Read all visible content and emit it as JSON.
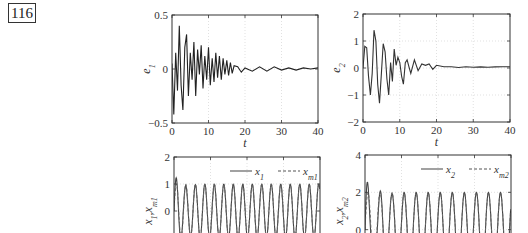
{
  "page": {
    "number": "116"
  },
  "chart_data": [
    {
      "id": "e1",
      "type": "line",
      "title": "",
      "xlabel": "t",
      "ylabel": "e1",
      "xlim": [
        0,
        40
      ],
      "ylim": [
        -0.5,
        0.5
      ],
      "xticks": [
        "0",
        "10",
        "20",
        "30",
        "40"
      ],
      "yticks": [
        "-0.5",
        "0",
        "0.5"
      ],
      "grid": true,
      "series": [
        {
          "name": "e1",
          "style": "solid",
          "color": "#222222",
          "x": [
            0,
            0.5,
            1,
            1.5,
            2,
            2.5,
            3,
            3.5,
            4,
            4.5,
            5,
            5.5,
            6,
            6.5,
            7,
            7.5,
            8,
            8.5,
            9,
            9.5,
            10,
            10.5,
            11,
            11.5,
            12,
            12.5,
            13,
            13.5,
            14,
            14.5,
            15,
            15.5,
            16,
            16.5,
            17,
            18,
            19,
            20,
            22,
            24,
            26,
            28,
            30,
            32,
            34,
            36,
            38,
            40
          ],
          "y": [
            0.05,
            -0.42,
            0.15,
            -0.2,
            0.4,
            -0.15,
            -0.38,
            0.2,
            0.32,
            -0.25,
            0.15,
            -0.1,
            0.25,
            -0.25,
            0.18,
            -0.05,
            0.22,
            -0.18,
            0.12,
            -0.1,
            0.2,
            -0.15,
            0.1,
            -0.12,
            0.15,
            -0.08,
            0.12,
            -0.1,
            0.1,
            -0.05,
            0.08,
            -0.06,
            0.06,
            -0.04,
            0.03,
            0.02,
            -0.03,
            0.01,
            -0.02,
            0.02,
            -0.02,
            0.02,
            -0.01,
            0.01,
            -0.01,
            0.01,
            0.0,
            0.01
          ]
        }
      ]
    },
    {
      "id": "e2",
      "type": "line",
      "title": "",
      "xlabel": "t",
      "ylabel": "e2",
      "xlim": [
        0,
        40
      ],
      "ylim": [
        -2,
        2
      ],
      "xticks": [
        "0",
        "10",
        "20",
        "30",
        "40"
      ],
      "yticks": [
        "-2",
        "-1",
        "0",
        "1",
        "2"
      ],
      "grid": true,
      "series": [
        {
          "name": "e2",
          "style": "solid",
          "color": "#333333",
          "x": [
            0,
            0.5,
            1,
            1.5,
            2,
            2.5,
            3,
            3.5,
            4,
            4.5,
            5,
            5.5,
            6,
            6.5,
            7,
            7.5,
            8,
            8.5,
            9,
            9.5,
            10,
            10.5,
            11,
            11.5,
            12,
            12.5,
            13,
            14,
            15,
            16,
            17,
            18,
            19,
            20,
            22,
            24,
            26,
            28,
            30,
            32,
            34,
            36,
            38,
            40
          ],
          "y": [
            0,
            0.8,
            0.75,
            -0.3,
            -1.0,
            -0.2,
            1.4,
            1.0,
            -0.6,
            -1.3,
            -0.2,
            0.9,
            0.6,
            -0.4,
            -1.0,
            0.2,
            -0.5,
            0.7,
            0.1,
            0.4,
            0.2,
            -0.3,
            -0.6,
            0.2,
            0.3,
            0.05,
            -0.2,
            0.3,
            -0.1,
            0.15,
            0.1,
            0.15,
            -0.05,
            0.1,
            0.05,
            0.05,
            0.02,
            0.05,
            0.03,
            0.04,
            0.03,
            0.04,
            0.05,
            0.05
          ]
        }
      ]
    },
    {
      "id": "x1",
      "type": "line",
      "title": "",
      "xlabel": "",
      "ylabel": "x1,xm1",
      "xlim": [
        0,
        40
      ],
      "ylim": [
        -2,
        2
      ],
      "xticks": [],
      "yticks": [
        "0",
        "1",
        "2"
      ],
      "grid": true,
      "legend": {
        "position": "upper right",
        "entries": [
          {
            "label": "x1",
            "style": "solid"
          },
          {
            "label": "xm1",
            "style": "dashed"
          }
        ]
      },
      "series": [
        {
          "name": "x1",
          "style": "solid",
          "color": "#444444",
          "amplitude": 1.0,
          "period": 2.6,
          "offset": 0
        },
        {
          "name": "xm1",
          "style": "dashed",
          "color": "#666666",
          "amplitude": 1.0,
          "period": 2.6,
          "offset": 0
        }
      ]
    },
    {
      "id": "x2",
      "type": "line",
      "title": "",
      "xlabel": "",
      "ylabel": "x2,xm2",
      "xlim": [
        0,
        40
      ],
      "ylim": [
        -2,
        4
      ],
      "xticks": [],
      "yticks": [
        "0",
        "2",
        "4"
      ],
      "grid": true,
      "legend": {
        "position": "upper right",
        "entries": [
          {
            "label": "x2",
            "style": "solid"
          },
          {
            "label": "xm2",
            "style": "dashed"
          }
        ]
      },
      "series": [
        {
          "name": "x2",
          "style": "solid",
          "color": "#444444",
          "amplitude": 2.0,
          "period": 3.3,
          "offset": 0
        },
        {
          "name": "xm2",
          "style": "dashed",
          "color": "#666666",
          "amplitude": 2.0,
          "period": 3.3,
          "offset": 0
        }
      ]
    }
  ]
}
